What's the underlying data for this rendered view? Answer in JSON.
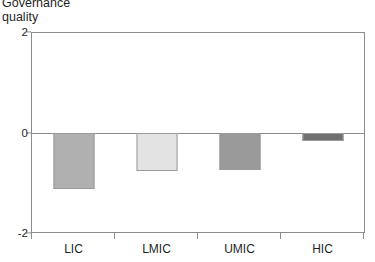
{
  "chart_data": {
    "type": "bar",
    "title_line1": "Governance",
    "title_line2": "quality",
    "xlabel": "",
    "ylabel": "Governance quality",
    "categories": [
      "LIC",
      "LMIC",
      "UMIC",
      "HIC"
    ],
    "values": [
      -1.14,
      -0.78,
      -0.76,
      -0.18
    ],
    "series": [
      {
        "name": "Governance quality",
        "values": [
          -1.14,
          -0.78,
          -0.76,
          -0.18
        ]
      }
    ],
    "bar_colors": [
      "#b0b0b0",
      "#e3e3e3",
      "#9a9a9a",
      "#707070"
    ],
    "bar_border_color": "#9a9a9a",
    "ylim": [
      -2,
      2
    ],
    "yticks": [
      2,
      0,
      -2
    ],
    "ytick_labels": [
      "2",
      "0",
      "-2"
    ],
    "grid": false,
    "zero_line": true,
    "legend": "none",
    "axis_color": "#8c8c8c"
  }
}
